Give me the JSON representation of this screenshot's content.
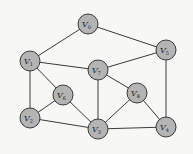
{
  "graph": {
    "style": {
      "background": "#f7f7f5",
      "node_fill": "#b4b4b4",
      "node_stroke": "#3a3a3a",
      "edge_color": "#3a3a3a",
      "node_radius": 10
    },
    "nodes": [
      {
        "id": "V0",
        "letter": "V",
        "sub": "0",
        "x": 88,
        "y": 24
      },
      {
        "id": "V1",
        "letter": "V",
        "sub": "1",
        "x": 30,
        "y": 61
      },
      {
        "id": "V2",
        "letter": "V",
        "sub": "2",
        "x": 30,
        "y": 118
      },
      {
        "id": "V3",
        "letter": "V",
        "sub": "3",
        "x": 98,
        "y": 129
      },
      {
        "id": "V4",
        "letter": "V",
        "sub": "4",
        "x": 166,
        "y": 127
      },
      {
        "id": "V5",
        "letter": "V",
        "sub": "5",
        "x": 166,
        "y": 50
      },
      {
        "id": "V6",
        "letter": "V",
        "sub": "6",
        "x": 63,
        "y": 95
      },
      {
        "id": "V7",
        "letter": "V",
        "sub": "7",
        "x": 98,
        "y": 70
      },
      {
        "id": "V8",
        "letter": "V",
        "sub": "8",
        "x": 137,
        "y": 93
      }
    ],
    "edges": [
      [
        "V0",
        "V1"
      ],
      [
        "V0",
        "V5"
      ],
      [
        "V1",
        "V7"
      ],
      [
        "V1",
        "V6"
      ],
      [
        "V1",
        "V2"
      ],
      [
        "V5",
        "V7"
      ],
      [
        "V5",
        "V4"
      ],
      [
        "V7",
        "V8"
      ],
      [
        "V7",
        "V3"
      ],
      [
        "V6",
        "V2"
      ],
      [
        "V6",
        "V3"
      ],
      [
        "V2",
        "V3"
      ],
      [
        "V8",
        "V3"
      ],
      [
        "V8",
        "V4"
      ],
      [
        "V3",
        "V4"
      ]
    ]
  }
}
